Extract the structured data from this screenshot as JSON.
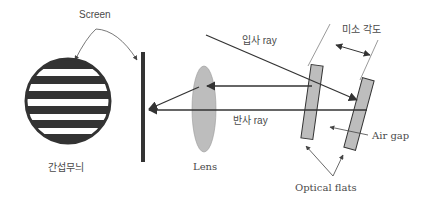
{
  "diagram": {
    "labels": {
      "screen": "Screen",
      "fringe": "간섭무늬",
      "lens": "Lens",
      "incident_ray": "입사 ray",
      "reflected_ray": "반사 ray",
      "small_angle": "미소 각도",
      "air_gap": "Air gap",
      "optical_flats": "Optical flats"
    },
    "colors": {
      "line": "#333333",
      "fill_gray": "#bdbdbd",
      "text": "#4a4a4a",
      "background": "#ffffff"
    },
    "fringe_pattern": {
      "dark_bands": 5
    }
  }
}
